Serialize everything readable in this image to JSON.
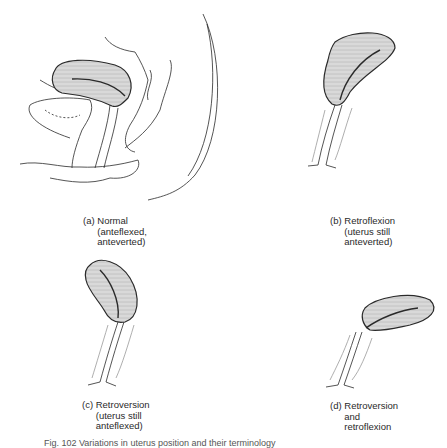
{
  "figure": {
    "caption": "Fig. 102 Variations in uterus position and their terminology",
    "panels": [
      {
        "id": "a",
        "tag": "(a)",
        "lines": [
          "Normal",
          "(anteflexed,",
          "anteverted)"
        ]
      },
      {
        "id": "b",
        "tag": "(b)",
        "lines": [
          "Retroflexion",
          "(uterus still",
          "anteverted)"
        ]
      },
      {
        "id": "c",
        "tag": "(c)",
        "lines": [
          "Retroversion",
          "(uterus still",
          "anteflexed)"
        ]
      },
      {
        "id": "d",
        "tag": "(d)",
        "lines": [
          "Retroversion",
          "and",
          "retroflexion"
        ]
      }
    ]
  },
  "colors": {
    "ink": "#2a2a2a",
    "fill": "#cfcfcf",
    "background": "#ffffff"
  }
}
